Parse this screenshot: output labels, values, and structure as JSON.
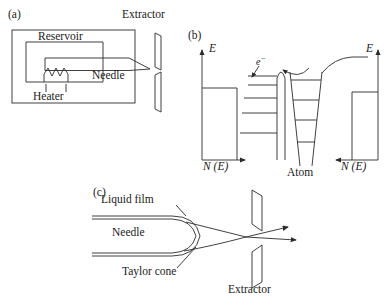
{
  "figure": {
    "background_color": "#ffffff",
    "line_color": "#2b2b2b"
  },
  "panel_a": {
    "id": "(a)",
    "labels": {
      "extractor": "Extractor",
      "reservoir": "Reservoir",
      "needle": "Needle",
      "heater": "Heater"
    }
  },
  "panel_b": {
    "id": "(b)",
    "labels": {
      "energy_left": "E",
      "energy_right": "E",
      "dos_left": "N (E)",
      "dos_right": "N (E)",
      "electron": "e",
      "electron_superscript": "−",
      "atom": "Atom"
    },
    "band_levels_count": 5,
    "atom_levels_count": 4
  },
  "panel_c": {
    "id": "(c)",
    "labels": {
      "liquid_film": "Liquid film",
      "needle": "Needle",
      "taylor_cone": "Taylor cone",
      "extractor": "Extractor"
    },
    "beam_arrows": 2
  }
}
